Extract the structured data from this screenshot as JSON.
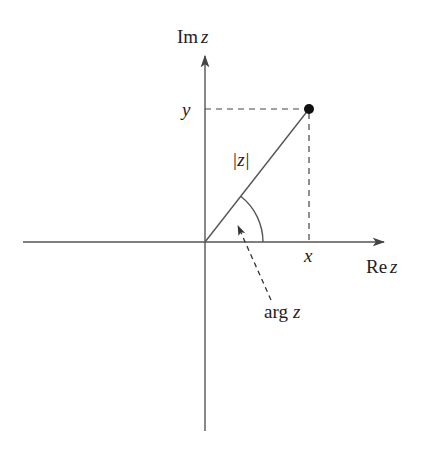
{
  "diagram": {
    "colors": {
      "stroke": "#555555",
      "text": "#222222",
      "point": "#111111"
    },
    "axes": {
      "imaginary_label_prefix": "Im",
      "imaginary_label_var": "z",
      "real_label_prefix": "Re",
      "real_label_var": "z"
    },
    "labels": {
      "y": "y",
      "x": "x",
      "modulus": "|z|",
      "argument_prefix": "arg",
      "argument_var": "z"
    },
    "geometry": {
      "origin": [
        205,
        242
      ],
      "point": [
        309,
        109
      ],
      "real_axis_range": [
        23,
        385
      ],
      "imag_axis_range": [
        55,
        431
      ],
      "arc_radius": 58
    }
  }
}
